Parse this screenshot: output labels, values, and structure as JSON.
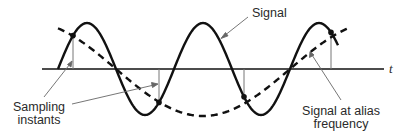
{
  "diagram": {
    "axis_label": "t",
    "labels": {
      "signal": "Signal",
      "sampling_line1": "Sampling",
      "sampling_line2": "instants",
      "alias_line1": "Signal at alias",
      "alias_line2": "frequency"
    },
    "signal": {
      "cycles_shown": 2.5,
      "style": "solid"
    },
    "alias_signal": {
      "cycles_shown": 1,
      "style": "dashed",
      "frequency_ratio_to_signal": 0.335
    },
    "sampling_instants": {
      "count": 4
    },
    "colors": {
      "curve": "#111111",
      "axis": "#111111",
      "sample_line": "#777777",
      "leader": "#666666",
      "text": "#2a2a2a"
    }
  }
}
